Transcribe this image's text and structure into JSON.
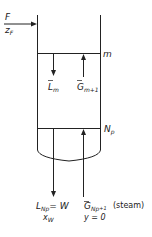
{
  "diagram": {
    "feed": {
      "label": "F",
      "composition": "z",
      "composition_sub": "F"
    },
    "tray_m": {
      "label": "m"
    },
    "tray_np": {
      "label": "N",
      "label_sub": "p"
    },
    "liquid_down_m": {
      "label": "L",
      "label_sub": "m"
    },
    "vapor_up_m": {
      "label": "G",
      "label_sub": "m+1"
    },
    "bottoms": {
      "label": "L",
      "label_sub": "Np",
      "equals": "= W",
      "composition": "x",
      "composition_sub": "W"
    },
    "steam": {
      "label": "G",
      "label_sub": "Np",
      "label_sub2": "+1",
      "note": "(steam)",
      "composition": "y = 0"
    },
    "colors": {
      "line": "#222222",
      "background": "#ffffff"
    }
  }
}
